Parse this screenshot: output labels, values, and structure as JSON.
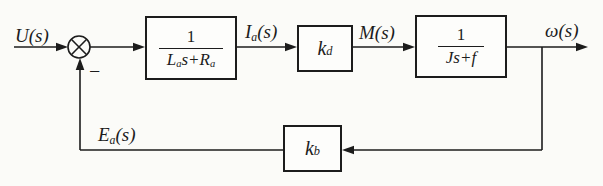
{
  "figure": {
    "type": "control-system-block-diagram",
    "colors": {
      "line": "#1c1c1c",
      "background": "#fbfbf8",
      "block_fill": "#fdfdfb"
    }
  },
  "summing_junction": {
    "minus_label": "−"
  },
  "signals": {
    "input": "U(s)",
    "armature_current": {
      "base": "I",
      "sub": "a",
      "suffix": "(s)"
    },
    "torque": "M(s)",
    "angular_speed": "ω(s)",
    "back_emf": {
      "base": "E",
      "sub": "a",
      "suffix": "(s)"
    }
  },
  "blocks": {
    "armature": {
      "numerator": "1",
      "den_base": "L",
      "den_sub1": "a",
      "den_mid": "s+R",
      "den_sub2": "a"
    },
    "torque_gain": {
      "base": "k",
      "sub": "d"
    },
    "mechanical": {
      "numerator": "1",
      "denominator": "Js+f"
    },
    "backemf_gain": {
      "base": "k",
      "sub": "b"
    }
  }
}
